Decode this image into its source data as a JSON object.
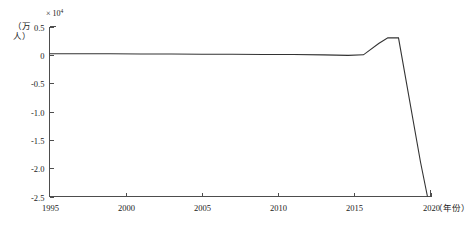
{
  "chart_data": {
    "type": "line",
    "title": "",
    "subtitle": "",
    "xlabel": "年份",
    "ylabel": "（万人）",
    "y_exponent_prefix": "× 10",
    "y_exponent_value": "4",
    "xlim": [
      1995,
      2020
    ],
    "ylim": [
      -2.5,
      0.5
    ],
    "xticks": [
      1995,
      2000,
      2005,
      2010,
      2015,
      2020
    ],
    "xticklabels": [
      "1995",
      "2000",
      "2005",
      "2010",
      "2015",
      "2020"
    ],
    "yticks": [
      0.5,
      0,
      -0.5,
      -1.0,
      -1.5,
      -2.0,
      -2.5
    ],
    "yticklabels": [
      "0.5",
      "0",
      "-0.5",
      "-1.0",
      "-1.5",
      "-2.0",
      "-2.5"
    ],
    "grid": false,
    "legend": null,
    "series": [
      {
        "name": "净人口变化",
        "color": "#333333",
        "x": [
          1995,
          1997,
          1999,
          2001,
          2003,
          2005,
          2007,
          2009,
          2011,
          2013,
          2014.6,
          2015.6,
          2016.6,
          2017.2,
          2017.9,
          2019.35,
          2019.8
        ],
        "values": [
          0.02,
          0.02,
          0.02,
          0.015,
          0.015,
          0.01,
          0.01,
          0.005,
          0.005,
          0.0,
          -0.01,
          0.0,
          0.2,
          0.3,
          0.3,
          -1.9,
          -2.5
        ]
      }
    ],
    "annotations": []
  },
  "axes": {
    "x_unit_label": "（年份）"
  }
}
